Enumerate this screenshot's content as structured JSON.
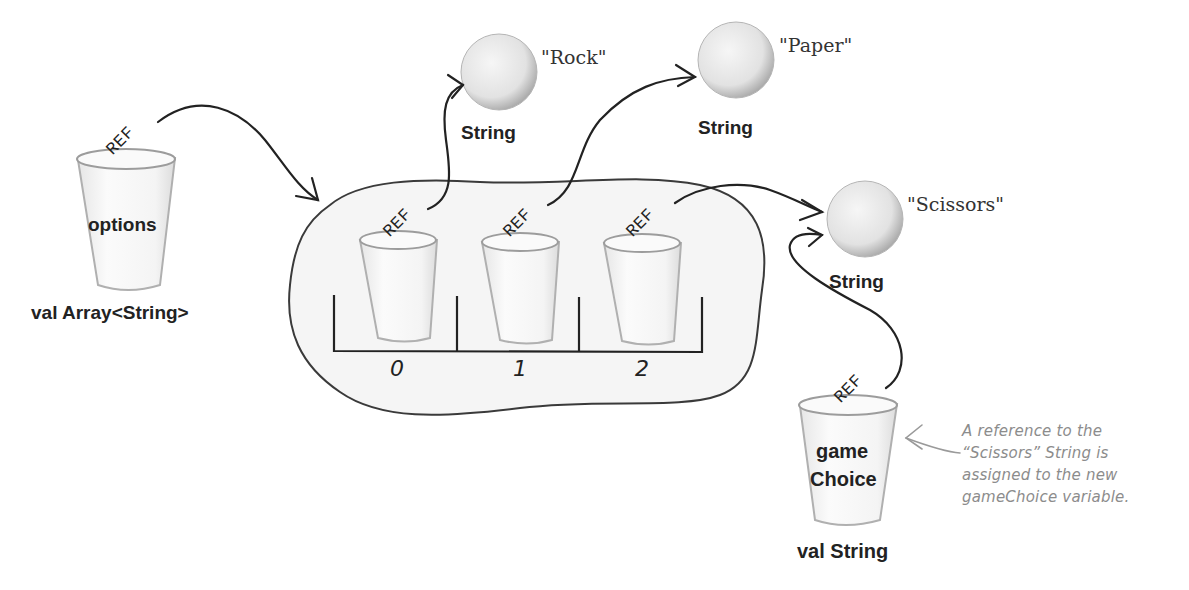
{
  "diagram": {
    "options_variable": {
      "cup_label": "options",
      "type_label": "val Array<String>",
      "ref_label": "REF"
    },
    "array": {
      "slots": [
        {
          "index": "0",
          "ref_label": "REF",
          "points_to": "Rock"
        },
        {
          "index": "1",
          "ref_label": "REF",
          "points_to": "Paper"
        },
        {
          "index": "2",
          "ref_label": "REF",
          "points_to": "Scissors"
        }
      ]
    },
    "objects": [
      {
        "value": "\"Rock\"",
        "type": "String"
      },
      {
        "value": "\"Paper\"",
        "type": "String"
      },
      {
        "value": "\"Scissors\"",
        "type": "String"
      }
    ],
    "game_choice_variable": {
      "cup_label_line1": "game",
      "cup_label_line2": "Choice",
      "type_label": "val String",
      "ref_label": "REF"
    },
    "annotation": {
      "line1": "A reference to the",
      "line2": "“Scissors” String is",
      "line3": "assigned to the new",
      "line4": "gameChoice variable."
    },
    "colors": {
      "ink": "#222222",
      "cup_outline": "#a8a8a8",
      "ball_fill": "#e4e4e4",
      "array_blob_fill": "#f4f4f4",
      "note_text": "#8c8c8c"
    }
  }
}
